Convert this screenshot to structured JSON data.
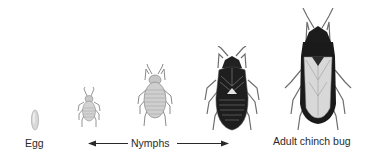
{
  "diagram": {
    "stages": [
      {
        "id": "egg",
        "label": "Egg"
      },
      {
        "id": "nymph-1",
        "label": ""
      },
      {
        "id": "nymph-2",
        "label": ""
      },
      {
        "id": "nymph-3",
        "label": ""
      },
      {
        "id": "adult",
        "label": "Adult chinch bug"
      }
    ],
    "labels": {
      "egg": "Egg",
      "nymphs": "Nymphs",
      "adult": "Adult chinch bug"
    },
    "colors": {
      "egg": "#d6d6d6",
      "nymph_small": "#cfcfcf",
      "nymph_mid": "#c4c4c4",
      "nymph_dark": "#1e1e1e",
      "adult_body": "#1a1a1a",
      "adult_wings": "#d9d9d9",
      "text": "#2a2a2a"
    }
  }
}
